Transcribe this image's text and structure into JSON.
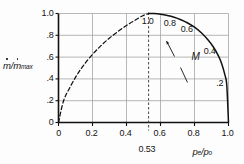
{
  "chart_data": {
    "type": "line",
    "title": "",
    "xlabel": "pe/po",
    "ylabel": "ṁ/ṁmax",
    "xlim": [
      0,
      1.0
    ],
    "ylim": [
      0,
      1.0
    ],
    "grid": true,
    "legend": "none",
    "x_ticks": [
      "0",
      "0.2",
      "0.4",
      "0.6",
      "0.8",
      "1.0"
    ],
    "x_tick_values": [
      0,
      0.2,
      0.4,
      0.6,
      0.8,
      1.0
    ],
    "y_ticks": [
      "1.0",
      ".8",
      ".6",
      ".4",
      ".2",
      "0"
    ],
    "y_tick_values": [
      1.0,
      0.8,
      0.6,
      0.4,
      0.2,
      0
    ],
    "series": [
      {
        "name": "subsonic-branch-solid",
        "style": "solid",
        "x": [
          0.53,
          0.56,
          0.6,
          0.64,
          0.68,
          0.72,
          0.76,
          0.8,
          0.84,
          0.88,
          0.91,
          0.94,
          0.96,
          0.98,
          0.99,
          1.0
        ],
        "values": [
          1.0,
          0.999,
          0.993,
          0.982,
          0.966,
          0.943,
          0.913,
          0.874,
          0.823,
          0.757,
          0.695,
          0.614,
          0.54,
          0.43,
          0.34,
          0.0
        ]
      },
      {
        "name": "unattainable-branch-dashed",
        "style": "dashed",
        "x": [
          0.0,
          0.03,
          0.07,
          0.11,
          0.15,
          0.2,
          0.25,
          0.3,
          0.35,
          0.4,
          0.45,
          0.5,
          0.53
        ],
        "values": [
          0.0,
          0.2,
          0.33,
          0.44,
          0.53,
          0.625,
          0.705,
          0.775,
          0.835,
          0.89,
          0.938,
          0.983,
          1.0
        ]
      }
    ],
    "critical_line": {
      "label": "0.53",
      "x": 0.53,
      "style": "dashed-vertical"
    },
    "mach_annotations": [
      {
        "label": "1.0",
        "x": 0.53,
        "y": 1.0
      },
      {
        "label": "0.8",
        "x": 0.66,
        "y": 0.975
      },
      {
        "label": "0.6",
        "x": 0.76,
        "y": 0.925
      },
      {
        "label": "0.4",
        "x": 0.895,
        "y": 0.72
      },
      {
        "label": ".2",
        "x": 0.955,
        "y": 0.43
      }
    ],
    "mach_symbol": {
      "label": "M",
      "x": 0.8,
      "y": 0.6
    }
  },
  "axis_labels": {
    "y_main": "m",
    "y_slash": "/",
    "y_den": "m",
    "y_sub": "max",
    "x_main": "p",
    "x_sub_1": "e",
    "x_slash": "/",
    "x_den": "p",
    "x_sub_2": "o"
  },
  "colors": {
    "curve": "#111111",
    "grid": "#9a9a9a",
    "axis": "#111111",
    "text": "#141414",
    "background": "#fdfdfd"
  }
}
